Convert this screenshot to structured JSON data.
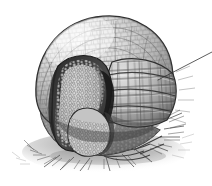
{
  "figure": {
    "kind": "scientific-illustration",
    "medium": "graphite-pencil-drawing",
    "subject_name": "three-banded armadillo rolled into a ball",
    "title": "",
    "caption": "",
    "label_text": "",
    "background_color": "#ffffff",
    "ink_color": "#2b2b2b",
    "shell_light": "#e8e8e8",
    "shell_mid": "#b9b9b9",
    "shell_dark": "#6f6f6f",
    "shadow_color": "#3a3a3a",
    "ground_color": "#8c8c8c"
  },
  "annotation": {
    "leader_line": {
      "name": "callout-leader-line",
      "from_x": 158,
      "from_y": 80,
      "to_x": 212,
      "to_y": 52,
      "stroke": "#333333",
      "stroke_width": 0.8,
      "label": ""
    }
  },
  "parts": [
    {
      "name": "carapace-dome",
      "label": "dome carapace"
    },
    {
      "name": "banded-armor",
      "label": "movable bands"
    },
    {
      "name": "head-shield",
      "label": "head shield"
    },
    {
      "name": "tucked-limb-crevice",
      "label": "tucked limb crevice"
    },
    {
      "name": "ground-grass",
      "label": "grass / ground"
    },
    {
      "name": "cast-shadow",
      "label": "cast shadow"
    }
  ]
}
